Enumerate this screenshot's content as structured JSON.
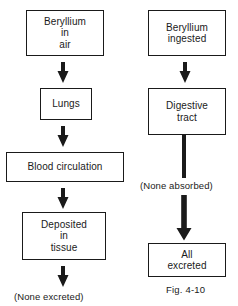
{
  "figure": {
    "number": "Fig. 4-10"
  },
  "pathways": {
    "inhalation": {
      "name": "inhalation-pathway",
      "steps": [
        {
          "id": "beryllium-air",
          "label": "Beryllium\nin\nair"
        },
        {
          "id": "lungs",
          "label": "Lungs"
        },
        {
          "id": "blood-circulation",
          "label": "Blood circulation"
        },
        {
          "id": "deposited-tissue",
          "label": "Deposited\nin\ntissue"
        }
      ],
      "outcome": "(None excreted)"
    },
    "ingestion": {
      "name": "ingestion-pathway",
      "steps": [
        {
          "id": "beryllium-ingested",
          "label": "Beryllium\ningested"
        },
        {
          "id": "digestive-tract",
          "label": "Digestive\ntract"
        },
        {
          "id": "all-excreted",
          "label": "All\nexcreted"
        }
      ],
      "annotation": "(None absorbed)"
    }
  },
  "colors": {
    "ink": "#1a1a1a",
    "paper": "#ffffff"
  }
}
